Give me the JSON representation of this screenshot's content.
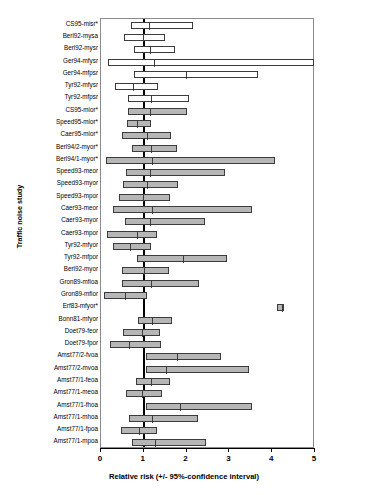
{
  "chart_data": {
    "type": "bar",
    "chart_style": "forest-plot",
    "title": "",
    "xlabel": "Relative risk (+/- 95%-confidence interval)",
    "ylabel": "Traffic noise study",
    "xlim": [
      0,
      5
    ],
    "xticks": [
      0,
      1,
      2,
      3,
      4,
      5
    ],
    "xticklabels": [
      "0",
      "1",
      "2",
      "3",
      "4",
      "5"
    ],
    "grid": false,
    "legend": "none",
    "reference_line": 1,
    "annotations": "Asterisk (*) after a study label marks selected studies; open (white) bars and shaded (grey) bars distinguish two study groups.",
    "categories": [
      "CS95-misr*",
      "Berl92-mysa",
      "Berl92-mysr",
      "Ger94-mfysr",
      "Ger94-mfpsr",
      "Tyr92-mfysr",
      "Tyr92-mfpsr",
      "CS95-mior*",
      "Speed95-mior*",
      "Caer95-mior*",
      "Berl94/2-myor*",
      "Berl94/1-myor*",
      "Speed93-meor",
      "Speed93-myor",
      "Speed93-mpor",
      "Caer93-meor",
      "Caer93-myor",
      "Caer93-mpor",
      "Tyr92-mfyor",
      "Tyr92-mfpor",
      "Berl92-myor",
      "Gron89-mfioa",
      "Gron89-mfior",
      "Erf83-mfyor*",
      "Bonn81-mfyor",
      "Doet79-feor",
      "Doet79-fpor",
      "Amst77/2-fvoa",
      "Amst77/2-mvoa",
      "Amst77/1-feoa",
      "Amst77/1-meoa",
      "Amst77/1-fhoa",
      "Amst77/1-mhoa",
      "Amst77/1-fpoa",
      "Amst77/1-mpoa"
    ],
    "series": [
      {
        "name": "Relative risk with 95% confidence interval",
        "points": [
          {
            "label": "CS95-misr*",
            "lower": 0.7,
            "estimate": 1.1,
            "upper": 2.15,
            "fill": "open"
          },
          {
            "label": "Berl92-mysa",
            "lower": 0.53,
            "estimate": 0.95,
            "upper": 1.5,
            "fill": "open"
          },
          {
            "label": "Berl92-mysr",
            "lower": 0.76,
            "estimate": 1.12,
            "upper": 1.72,
            "fill": "open"
          },
          {
            "label": "Ger94-mfysr",
            "lower": 0.16,
            "estimate": 1.22,
            "upper": 4.98,
            "fill": "open"
          },
          {
            "label": "Ger94-mfpsr",
            "lower": 0.78,
            "estimate": 1.97,
            "upper": 3.66,
            "fill": "open"
          },
          {
            "label": "Tyr92-mfysr",
            "lower": 0.32,
            "estimate": 0.73,
            "upper": 1.34,
            "fill": "open"
          },
          {
            "label": "Tyr92-mfpsr",
            "lower": 0.62,
            "estimate": 1.14,
            "upper": 2.05,
            "fill": "open"
          },
          {
            "label": "CS95-mior*",
            "lower": 0.62,
            "estimate": 1.12,
            "upper": 2.02,
            "fill": "filled"
          },
          {
            "label": "Speed95-mior*",
            "lower": 0.6,
            "estimate": 0.82,
            "upper": 1.16,
            "fill": "filled"
          },
          {
            "label": "Caer95-mior*",
            "lower": 0.5,
            "estimate": 1.04,
            "upper": 1.63,
            "fill": "filled"
          },
          {
            "label": "Berl94/2-myor*",
            "lower": 0.73,
            "estimate": 1.14,
            "upper": 1.78,
            "fill": "filled"
          },
          {
            "label": "Berl94/1-myor*",
            "lower": 0.11,
            "estimate": 1.17,
            "upper": 4.06,
            "fill": "filled"
          },
          {
            "label": "Speed93-meor",
            "lower": 0.59,
            "estimate": 1.12,
            "upper": 2.9,
            "fill": "filled"
          },
          {
            "label": "Speed93-myor",
            "lower": 0.51,
            "estimate": 1.06,
            "upper": 1.8,
            "fill": "filled"
          },
          {
            "label": "Speed93-mpor",
            "lower": 0.43,
            "estimate": 0.96,
            "upper": 1.61,
            "fill": "filled"
          },
          {
            "label": "Caer93-meor",
            "lower": 0.28,
            "estimate": 1.16,
            "upper": 3.52,
            "fill": "filled"
          },
          {
            "label": "Caer93-myor",
            "lower": 0.57,
            "estimate": 1.12,
            "upper": 2.42,
            "fill": "filled"
          },
          {
            "label": "Caer93-mpor",
            "lower": 0.15,
            "estimate": 0.82,
            "upper": 1.3,
            "fill": "filled"
          },
          {
            "label": "Tyr92-mfyor",
            "lower": 0.27,
            "estimate": 0.65,
            "upper": 1.18,
            "fill": "filled"
          },
          {
            "label": "Tyr92-mfpor",
            "lower": 0.85,
            "estimate": 1.9,
            "upper": 2.95,
            "fill": "filled"
          },
          {
            "label": "Berl92-myor",
            "lower": 0.5,
            "estimate": 0.98,
            "upper": 1.6,
            "fill": "filled"
          },
          {
            "label": "Gron89-mfioa",
            "lower": 0.48,
            "estimate": 1.15,
            "upper": 2.3,
            "fill": "filled"
          },
          {
            "label": "Gron89-mfior",
            "lower": 0.08,
            "estimate": 0.53,
            "upper": 1.08,
            "fill": "filled"
          },
          {
            "label": "Erf83-mfyor*",
            "lower": 4.12,
            "estimate": 4.2,
            "upper": 4.28,
            "fill": "filled"
          },
          {
            "label": "Bonn81-mfyor",
            "lower": 0.86,
            "estimate": 1.16,
            "upper": 1.65,
            "fill": "filled"
          },
          {
            "label": "Doet79-feor",
            "lower": 0.52,
            "estimate": 0.93,
            "upper": 1.38,
            "fill": "filled"
          },
          {
            "label": "Doet79-fpor",
            "lower": 0.22,
            "estimate": 0.62,
            "upper": 1.4,
            "fill": "filled"
          },
          {
            "label": "Amst77/2-fvoa",
            "lower": 1.05,
            "estimate": 1.76,
            "upper": 2.8,
            "fill": "filled"
          },
          {
            "label": "Amst77/2-mvoa",
            "lower": 1.05,
            "estimate": 1.5,
            "upper": 3.46,
            "fill": "filled"
          },
          {
            "label": "Amst77/1-feoa",
            "lower": 0.82,
            "estimate": 1.14,
            "upper": 1.62,
            "fill": "filled"
          },
          {
            "label": "Amst77/1-meoa",
            "lower": 0.58,
            "estimate": 0.94,
            "upper": 1.42,
            "fill": "filled"
          },
          {
            "label": "Amst77/1-fhoa",
            "lower": 1.05,
            "estimate": 1.82,
            "upper": 3.52,
            "fill": "filled"
          },
          {
            "label": "Amst77/1-mhoa",
            "lower": 0.65,
            "estimate": 1.18,
            "upper": 2.26,
            "fill": "filled"
          },
          {
            "label": "Amst77/1-fpoa",
            "lower": 0.46,
            "estimate": 0.86,
            "upper": 1.3,
            "fill": "filled"
          },
          {
            "label": "Amst77/1-mpoa",
            "lower": 0.72,
            "estimate": 1.25,
            "upper": 2.45,
            "fill": "filled"
          }
        ]
      }
    ],
    "colors": {
      "open_bar_fill": "#ffffff",
      "filled_bar_fill": "#b6b6b6",
      "bar_border": "#3c3c3c",
      "reference_line": "#000000",
      "axis": "#000000",
      "plot_border": "#8a8a8a",
      "background": "#ffffff"
    }
  }
}
